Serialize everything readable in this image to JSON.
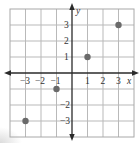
{
  "chart_data": {
    "type": "scatter",
    "title": "",
    "xlabel": "x",
    "ylabel": "y",
    "xlim": [
      -4,
      4
    ],
    "ylim": [
      -4,
      4
    ],
    "grid": true,
    "legend": null,
    "x_tick_labels": [
      "-3",
      "-2",
      "-1",
      "1",
      "2",
      "3"
    ],
    "y_tick_labels": [
      "3",
      "2",
      "1",
      "-2",
      "-3"
    ],
    "points": [
      {
        "x": -3,
        "y": -3
      },
      {
        "x": -1,
        "y": -1
      },
      {
        "x": 1,
        "y": 1
      },
      {
        "x": 3,
        "y": 3
      }
    ],
    "colors": {
      "point": "#6a6a6a",
      "axis": "#2a2a2a",
      "grid": "#b9b9b9"
    }
  },
  "labels": {
    "x_axis": "x",
    "y_axis": "y",
    "xt_m3": "−3",
    "xt_m2": "−2",
    "xt_m1": "−1",
    "xt_1": "1",
    "xt_2": "2",
    "xt_3": "3",
    "yt_3": "3",
    "yt_2": "2",
    "yt_1": "1",
    "yt_m2": "−2",
    "yt_m3": "−3"
  }
}
